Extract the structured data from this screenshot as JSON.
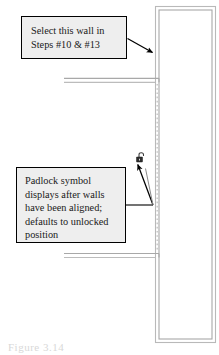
{
  "figure": {
    "caption": "Figure 3.14",
    "drawing_type": "architectural-wall-plan"
  },
  "callouts": [
    {
      "id": "select-wall",
      "name": "callout-select-wall",
      "lines": [
        "Select this wall in",
        "Steps #10 & #13"
      ],
      "fill": "#eeeeee",
      "border": "#000000"
    },
    {
      "id": "padlock",
      "name": "callout-padlock",
      "lines": [
        "Padlock symbol",
        "displays after walls",
        "have been aligned;",
        "defaults to unlocked",
        "position"
      ],
      "fill": "#eeeeee",
      "border": "#000000"
    }
  ],
  "drawing": {
    "vertical_wall": {
      "label": "vertical-wall",
      "color": "#b4b4b4"
    },
    "upper_horizontal_wall": {
      "label": "upper-horizontal-wall",
      "color": "#b4b4b4"
    },
    "lower_horizontal_wall": {
      "label": "lower-horizontal-wall",
      "color": "#b4b4b4"
    },
    "alignment_guide": {
      "label": "alignment-dotted-guide",
      "color": "#c8c8c8",
      "style": "dotted"
    },
    "padlock": {
      "label": "padlock-unlocked-icon",
      "state": "unlocked",
      "color": "#303030"
    }
  },
  "leaders": {
    "select_wall_arrow": {
      "label": "leader-arrow-to-wall",
      "color": "#000000"
    },
    "padlock_arrow": {
      "label": "leader-arrow-to-padlock",
      "color": "#000000"
    },
    "padlock_branch": {
      "label": "leader-branch-line",
      "color": "#000000"
    }
  }
}
